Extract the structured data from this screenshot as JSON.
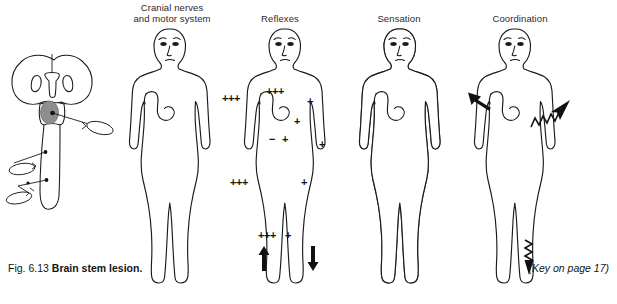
{
  "figure": {
    "caption_label": "Fig. 6.13",
    "caption_title": "Brain stem lesion.",
    "key_note": "(Key on page 17)",
    "background_color": "#ffffff",
    "ink_color": "#1a1a1a",
    "shade_color": "#9a9a9a"
  },
  "columns": [
    {
      "id": "cranial",
      "label": "Cranial nerves\nand motor system"
    },
    {
      "id": "reflexes",
      "label": "Reflexes"
    },
    {
      "id": "sensation",
      "label": "Sensation"
    },
    {
      "id": "coordination",
      "label": "Coordination"
    }
  ],
  "panels": {
    "brainstem": {
      "name": "brain-stem-lesion-diagram",
      "lesion_color": "#8e8e8e",
      "lesion_description": "Shaded oval lesion in the pons with black dot marking the site",
      "nerve_tracts": 3
    },
    "cranial": {
      "name": "cranial-nerves-motor-system-figure",
      "shaded": false,
      "markers": []
    },
    "reflexes": {
      "name": "reflexes-figure",
      "markers": [
        {
          "id": "left-arm-outer",
          "text": "+++",
          "x": 222,
          "y": 99
        },
        {
          "id": "left-shoulder",
          "text": "+++",
          "x": 268,
          "y": 93
        },
        {
          "id": "right-upper-arm",
          "text": "+",
          "x": 311,
          "y": 102
        },
        {
          "id": "right-elbow",
          "text": "+",
          "x": 298,
          "y": 122
        },
        {
          "id": "right-forearm",
          "text": "+",
          "x": 322,
          "y": 145
        },
        {
          "id": "abdomen-left",
          "text": "−",
          "x": 272,
          "y": 140
        },
        {
          "id": "abdomen-right",
          "text": "+",
          "x": 284,
          "y": 140
        },
        {
          "id": "left-leg",
          "text": "+++",
          "x": 232,
          "y": 182
        },
        {
          "id": "right-leg",
          "text": "+",
          "x": 304,
          "y": 182
        },
        {
          "id": "left-ankle",
          "text": "+++",
          "x": 262,
          "y": 235
        },
        {
          "id": "right-ankle",
          "text": "+",
          "x": 288,
          "y": 235
        }
      ],
      "arrows": [
        {
          "id": "left-plantar-up",
          "direction": "up",
          "x": 265,
          "y": 250
        },
        {
          "id": "right-plantar-down",
          "direction": "down",
          "x": 314,
          "y": 250
        }
      ]
    },
    "sensation": {
      "name": "sensation-figure",
      "shaded": true,
      "shade_side_body": "left",
      "shade_side_face": "right",
      "shade_color": "#9a9a9a"
    },
    "coordination": {
      "name": "coordination-figure",
      "arrows": [
        {
          "id": "left-shoulder-straight",
          "style": "straight",
          "direction": "up-left",
          "x": 470,
          "y": 95
        },
        {
          "id": "right-arm-tremor",
          "style": "zigzag",
          "direction": "up-right",
          "x": 545,
          "y": 110
        },
        {
          "id": "right-foot-tremor",
          "style": "zigzag",
          "direction": "down",
          "x": 529,
          "y": 255
        }
      ]
    }
  }
}
